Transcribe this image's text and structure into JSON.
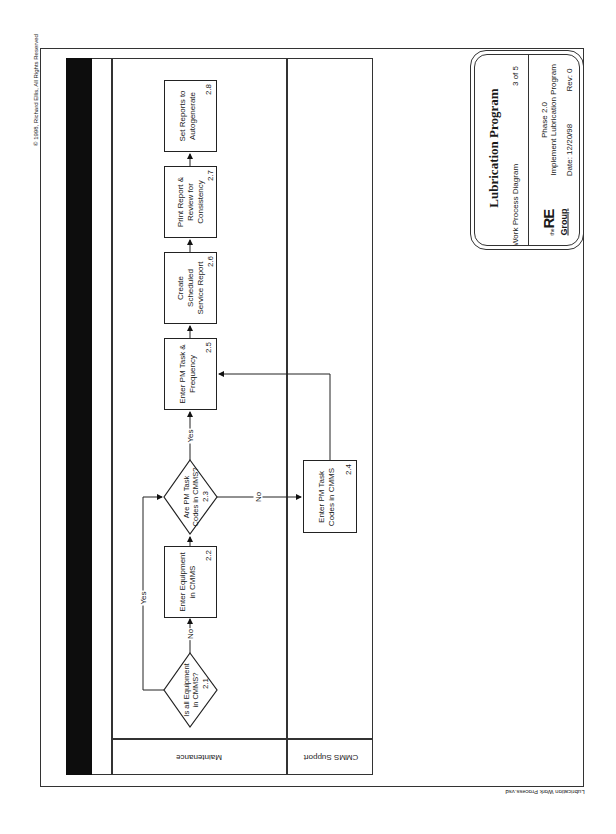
{
  "copyright": "© 1998, Richard Ellis, All Rights Reserved",
  "footer_filename": "Lubrication Work Process.vsd",
  "swimlanes": [
    {
      "label": "Maintenance"
    },
    {
      "label": "CMMS Support"
    }
  ],
  "steps": [
    {
      "id": "2.1",
      "type": "decision",
      "lines": [
        "Is all Equipment",
        "in CMMS?"
      ],
      "lane": "Maintenance"
    },
    {
      "id": "2.2",
      "type": "process",
      "lines": [
        "Enter Equipment",
        "in CMMS"
      ],
      "lane": "Maintenance"
    },
    {
      "id": "2.3",
      "type": "decision",
      "lines": [
        "Are PM Task",
        "Codes in CMMS?"
      ],
      "lane": "Maintenance"
    },
    {
      "id": "2.4",
      "type": "process",
      "lines": [
        "Enter PM Task",
        "Codes in CMMS"
      ],
      "lane": "CMMS Support"
    },
    {
      "id": "2.5",
      "type": "process",
      "lines": [
        "Enter PM Task &",
        "Frequency"
      ],
      "lane": "Maintenance"
    },
    {
      "id": "2.6",
      "type": "process",
      "lines": [
        "Create",
        "Scheduled",
        "Service Report"
      ],
      "lane": "Maintenance"
    },
    {
      "id": "2.7",
      "type": "process",
      "lines": [
        "Print Report &",
        "Review for",
        "Consistency"
      ],
      "lane": "Maintenance"
    },
    {
      "id": "2.8",
      "type": "process",
      "lines": [
        "Set Reports to",
        "Autogenerate"
      ],
      "lane": "Maintenance"
    }
  ],
  "connectors": [
    {
      "from": "2.1",
      "to": "2.2",
      "label": "No"
    },
    {
      "from": "2.1",
      "to": "2.3",
      "label": "Yes"
    },
    {
      "from": "2.2",
      "to": "2.3",
      "label": ""
    },
    {
      "from": "2.3",
      "to": "2.5",
      "label": "Yes"
    },
    {
      "from": "2.3",
      "to": "2.4",
      "label": "No"
    },
    {
      "from": "2.4",
      "to": "2.5",
      "label": ""
    },
    {
      "from": "2.5",
      "to": "2.6",
      "label": ""
    },
    {
      "from": "2.6",
      "to": "2.7",
      "label": ""
    },
    {
      "from": "2.7",
      "to": "2.8",
      "label": ""
    }
  ],
  "labels": {
    "yes": "Yes",
    "no": "No"
  },
  "title_block": {
    "title": "Lubrication Program",
    "subtitle": "Work Process Diagram",
    "page": "3 of 5",
    "phase": "Phase 2.0",
    "phase_name": "Implement Lubrication Program",
    "date": "Date: 12/20/98",
    "rev": "Rev: 0",
    "logo_the": "the",
    "logo_re": "RE",
    "logo_group": "Group"
  }
}
